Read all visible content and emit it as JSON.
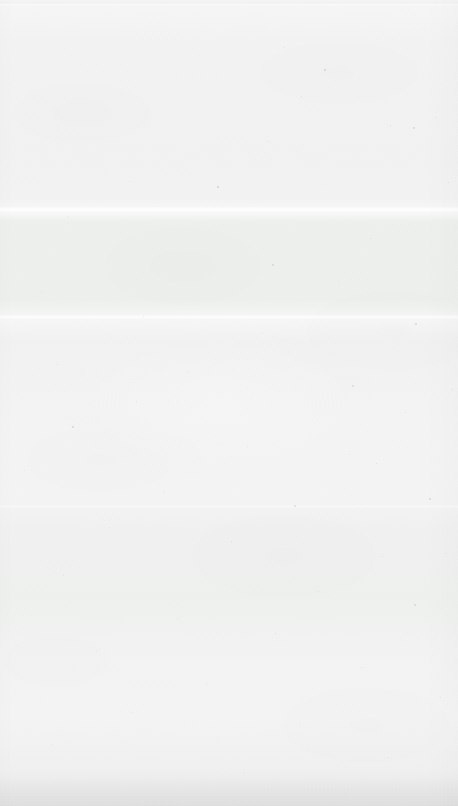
{
  "page": {
    "kind": "scanned-blank-page",
    "width_px": 458,
    "height_px": 806,
    "text_content": "",
    "has_text": false,
    "has_graphics": false
  },
  "colors": {
    "paper_light": "#f5f6f5",
    "paper_base": "#f3f4f3",
    "paper_shade": "#eef0ee",
    "seam_highlight": "#f8f9f8",
    "bottom_edge": "#e6e7e6",
    "speck": "#9aa09a"
  },
  "scan_artifacts": {
    "seams": [
      {
        "name": "top-edge-seam",
        "y_px": 4,
        "height_px": 2,
        "brightness": "high"
      },
      {
        "name": "upper-stitch-seam",
        "y_px": 207,
        "height_px": 5,
        "brightness": "high"
      },
      {
        "name": "mid-stitch-seam",
        "y_px": 315,
        "height_px": 4,
        "brightness": "medium"
      },
      {
        "name": "lower-stitch-seam",
        "y_px": 505,
        "height_px": 3,
        "brightness": "low"
      }
    ],
    "tonal_bands": [
      {
        "name": "upper-band",
        "from_px": 222,
        "to_px": 300,
        "tone": "#eef0ee"
      },
      {
        "name": "lower-band",
        "from_px": 530,
        "to_px": 620,
        "tone": "#eff1ef"
      }
    ],
    "edges": {
      "bottom_shadow": true,
      "right_soft_edge": true,
      "left_soft_edge": true
    }
  },
  "specks": [
    {
      "x": 324,
      "y": 69,
      "d": 1.6,
      "o": 0.34
    },
    {
      "x": 390,
      "y": 125,
      "d": 1.4,
      "o": 0.3
    },
    {
      "x": 413,
      "y": 127,
      "d": 1.5,
      "o": 0.28
    },
    {
      "x": 217,
      "y": 186,
      "d": 1.8,
      "o": 0.38
    },
    {
      "x": 268,
      "y": 141,
      "d": 1.2,
      "o": 0.24
    },
    {
      "x": 301,
      "y": 96,
      "d": 1.3,
      "o": 0.26
    },
    {
      "x": 436,
      "y": 117,
      "d": 1.4,
      "o": 0.27
    },
    {
      "x": 129,
      "y": 181,
      "d": 1.2,
      "o": 0.22
    },
    {
      "x": 68,
      "y": 216,
      "d": 1.3,
      "o": 0.24
    },
    {
      "x": 272,
      "y": 264,
      "d": 1.5,
      "o": 0.3
    },
    {
      "x": 370,
      "y": 238,
      "d": 1.2,
      "o": 0.22
    },
    {
      "x": 41,
      "y": 291,
      "d": 1.4,
      "o": 0.26
    },
    {
      "x": 338,
      "y": 281,
      "d": 1.3,
      "o": 0.23
    },
    {
      "x": 143,
      "y": 316,
      "d": 1.2,
      "o": 0.21
    },
    {
      "x": 262,
      "y": 333,
      "d": 1.4,
      "o": 0.25
    },
    {
      "x": 415,
      "y": 323,
      "d": 1.6,
      "o": 0.3
    },
    {
      "x": 57,
      "y": 364,
      "d": 1.3,
      "o": 0.24
    },
    {
      "x": 188,
      "y": 372,
      "d": 1.2,
      "o": 0.22
    },
    {
      "x": 352,
      "y": 385,
      "d": 1.5,
      "o": 0.28
    },
    {
      "x": 136,
      "y": 401,
      "d": 1.4,
      "o": 0.26
    },
    {
      "x": 405,
      "y": 412,
      "d": 1.3,
      "o": 0.24
    },
    {
      "x": 72,
      "y": 426,
      "d": 1.5,
      "o": 0.29
    },
    {
      "x": 247,
      "y": 446,
      "d": 1.2,
      "o": 0.21
    },
    {
      "x": 376,
      "y": 463,
      "d": 1.4,
      "o": 0.26
    },
    {
      "x": 349,
      "y": 454,
      "d": 1.3,
      "o": 0.23
    },
    {
      "x": 24,
      "y": 470,
      "d": 1.2,
      "o": 0.21
    },
    {
      "x": 163,
      "y": 491,
      "d": 1.3,
      "o": 0.23
    },
    {
      "x": 294,
      "y": 505,
      "d": 1.5,
      "o": 0.27
    },
    {
      "x": 429,
      "y": 498,
      "d": 1.6,
      "o": 0.31
    },
    {
      "x": 109,
      "y": 527,
      "d": 1.2,
      "o": 0.2
    },
    {
      "x": 231,
      "y": 541,
      "d": 1.3,
      "o": 0.23
    },
    {
      "x": 382,
      "y": 556,
      "d": 1.4,
      "o": 0.25
    },
    {
      "x": 63,
      "y": 575,
      "d": 1.2,
      "o": 0.21
    },
    {
      "x": 318,
      "y": 591,
      "d": 1.3,
      "o": 0.23
    },
    {
      "x": 414,
      "y": 604,
      "d": 1.5,
      "o": 0.27
    },
    {
      "x": 177,
      "y": 618,
      "d": 1.2,
      "o": 0.2
    },
    {
      "x": 275,
      "y": 633,
      "d": 1.3,
      "o": 0.22
    },
    {
      "x": 96,
      "y": 651,
      "d": 1.2,
      "o": 0.19
    },
    {
      "x": 361,
      "y": 667,
      "d": 1.3,
      "o": 0.22
    },
    {
      "x": 206,
      "y": 684,
      "d": 1.2,
      "o": 0.19
    },
    {
      "x": 440,
      "y": 697,
      "d": 1.4,
      "o": 0.24
    },
    {
      "x": 132,
      "y": 712,
      "d": 1.2,
      "o": 0.18
    },
    {
      "x": 299,
      "y": 726,
      "d": 1.3,
      "o": 0.21
    },
    {
      "x": 52,
      "y": 744,
      "d": 1.2,
      "o": 0.18
    },
    {
      "x": 387,
      "y": 757,
      "d": 1.3,
      "o": 0.2
    },
    {
      "x": 244,
      "y": 772,
      "d": 1.2,
      "o": 0.18
    },
    {
      "x": 448,
      "y": 182,
      "d": 1.3,
      "o": 0.24
    },
    {
      "x": 452,
      "y": 389,
      "d": 1.4,
      "o": 0.25
    },
    {
      "x": 445,
      "y": 553,
      "d": 1.3,
      "o": 0.22
    },
    {
      "x": 284,
      "y": 47,
      "d": 1.2,
      "o": 0.22
    }
  ]
}
